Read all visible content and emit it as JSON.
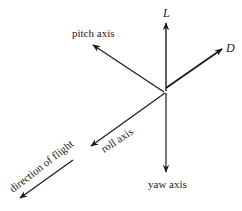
{
  "diagram": {
    "type": "aircraft-axes-force-diagram",
    "labels": {
      "lift": "L",
      "drag": "D",
      "pitch": "pitch axis",
      "roll": "roll axis",
      "yaw": "yaw axis",
      "direction": "direction of flight"
    },
    "colors": {
      "stroke": "#1a1a1a",
      "background": "#ffffff"
    }
  }
}
